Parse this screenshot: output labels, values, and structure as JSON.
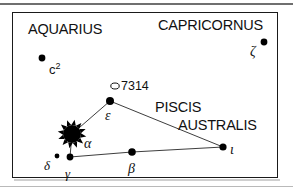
{
  "figure": {
    "kind": "star-chart",
    "background": "#ffffff",
    "frame_color": "#1a1a1a",
    "ink_color": "#111111",
    "rule_color": "#8d8d8d"
  },
  "constellation_labels": [
    {
      "id": "aquarius",
      "text": "AQUARIUS",
      "x": 28,
      "y": 22
    },
    {
      "id": "capricornus",
      "text": "CAPRICORNUS",
      "x": 158,
      "y": 18
    },
    {
      "id": "piscis",
      "text": "PISCIS",
      "x": 155,
      "y": 100
    },
    {
      "id": "australis",
      "text": "AUSTRALIS",
      "x": 178,
      "y": 118
    }
  ],
  "stars": [
    {
      "id": "alpha",
      "label": "α",
      "x": 72,
      "y": 134,
      "magnitude_size": 9,
      "style": "burst",
      "label_x": 84,
      "label_y": 137
    },
    {
      "id": "epsilon",
      "label": "ε",
      "x": 110,
      "y": 101,
      "magnitude_size": 4,
      "style": "dot",
      "label_x": 105,
      "label_y": 109
    },
    {
      "id": "iota",
      "label": "ι",
      "x": 223,
      "y": 147,
      "magnitude_size": 3.6,
      "style": "dot",
      "label_x": 230,
      "label_y": 143
    },
    {
      "id": "beta",
      "label": "β",
      "x": 132,
      "y": 152,
      "magnitude_size": 3.8,
      "style": "dot",
      "label_x": 128,
      "label_y": 162
    },
    {
      "id": "gamma",
      "label": "γ",
      "x": 70,
      "y": 157,
      "magnitude_size": 3.4,
      "style": "dot",
      "label_x": 65,
      "label_y": 167
    },
    {
      "id": "delta",
      "label": "δ",
      "x": 57,
      "y": 156,
      "magnitude_size": 2.4,
      "style": "dot",
      "label_x": 44,
      "label_y": 159
    },
    {
      "id": "zeta",
      "label": "ζ",
      "x": 264,
      "y": 42,
      "magnitude_size": 3.4,
      "style": "dot",
      "label_x": 250,
      "label_y": 45
    }
  ],
  "field_stars": [
    {
      "id": "c2",
      "label": "c",
      "superscript": "2",
      "x": 42,
      "y": 58,
      "magnitude_size": 3.4,
      "label_x": 49,
      "label_y": 62
    }
  ],
  "deep_sky": [
    {
      "id": "ngc7314",
      "label": "7314",
      "symbol": "open-ellipse",
      "x": 115,
      "y": 86,
      "rx": 4.2,
      "ry": 3.0,
      "label_x": 121,
      "label_y": 80
    }
  ],
  "constellation_lines": [
    {
      "from": "epsilon",
      "to": "alpha"
    },
    {
      "from": "epsilon",
      "to": "iota"
    },
    {
      "from": "iota",
      "to": "beta"
    },
    {
      "from": "beta",
      "to": "gamma"
    },
    {
      "from": "gamma",
      "to": "alpha"
    }
  ],
  "accessibility": {
    "caption": "Chart of Piscis Australis with Fomalhaut (alpha) as a bright burst, bordered by Aquarius and Capricornus."
  }
}
